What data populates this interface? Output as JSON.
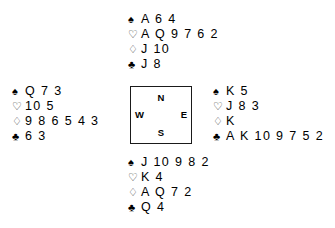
{
  "deal": {
    "suit_symbols": {
      "spade": "♠",
      "heart": "♡",
      "diamond": "♢",
      "club": "♣"
    },
    "hands": {
      "north": {
        "label": "North",
        "spades": "A 6 4",
        "hearts": "A Q 9 7 6 2",
        "diamonds": "J 10",
        "clubs": "J 8"
      },
      "west": {
        "label": "West",
        "spades": "Q 7 3",
        "hearts": "10 5",
        "diamonds": "9 8 6 5 4 3",
        "clubs": "6 3"
      },
      "east": {
        "label": "East",
        "spades": "K 5",
        "hearts": "J 8 3",
        "diamonds": "K",
        "clubs": "A K 10 9 7 5 2"
      },
      "south": {
        "label": "South",
        "spades": "J 10 9 8 2",
        "hearts": "K 4",
        "diamonds": "A Q 7 2",
        "clubs": "Q 4"
      }
    },
    "compass": {
      "north": "N",
      "south": "S",
      "east": "E",
      "west": "W"
    }
  }
}
